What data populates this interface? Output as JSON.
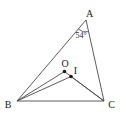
{
  "figure": {
    "type": "geometry-diagram",
    "vertex_labels": {
      "A": "A",
      "B": "B",
      "C": "C"
    },
    "point_labels": {
      "O": "O",
      "I": "I"
    },
    "angle_A_label": "54°",
    "colors": {
      "line": "#4a4a4a",
      "text": "#222222",
      "background": "#ffffff"
    }
  }
}
